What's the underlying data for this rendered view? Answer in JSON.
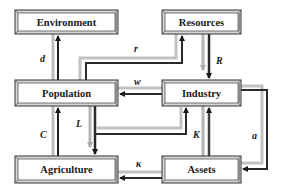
{
  "diagram": {
    "type": "system-dynamics-block-diagram",
    "nodes": [
      {
        "id": "environment",
        "label": "Environment"
      },
      {
        "id": "resources",
        "label": "Resources"
      },
      {
        "id": "population",
        "label": "Population"
      },
      {
        "id": "industry",
        "label": "Industry"
      },
      {
        "id": "agriculture",
        "label": "Agriculture"
      },
      {
        "id": "assets",
        "label": "Assets"
      }
    ],
    "edges": [
      {
        "from": "population",
        "to": "environment",
        "label": "d"
      },
      {
        "from": "population",
        "to": "resources",
        "label": "r"
      },
      {
        "from": "resources",
        "to": "industry",
        "label": "R"
      },
      {
        "from": "industry",
        "to": "population",
        "label": "w"
      },
      {
        "from": "population",
        "to": "agriculture",
        "label": "L"
      },
      {
        "from": "population",
        "to": "industry",
        "label": ""
      },
      {
        "from": "agriculture",
        "to": "population",
        "label": "C"
      },
      {
        "from": "assets",
        "to": "industry",
        "label": "K"
      },
      {
        "from": "industry",
        "to": "assets",
        "label": "a"
      },
      {
        "from": "assets",
        "to": "agriculture",
        "label": "κ"
      }
    ],
    "colors": {
      "box_fill": "#ffffff",
      "box_border_dark": "#333333",
      "box_bevel_light": "#cfcfcf",
      "box_bevel_mid": "#8a8a8a",
      "arrow_dark": "#2a2a2a",
      "arrow_light": "#b5b5b5"
    }
  }
}
